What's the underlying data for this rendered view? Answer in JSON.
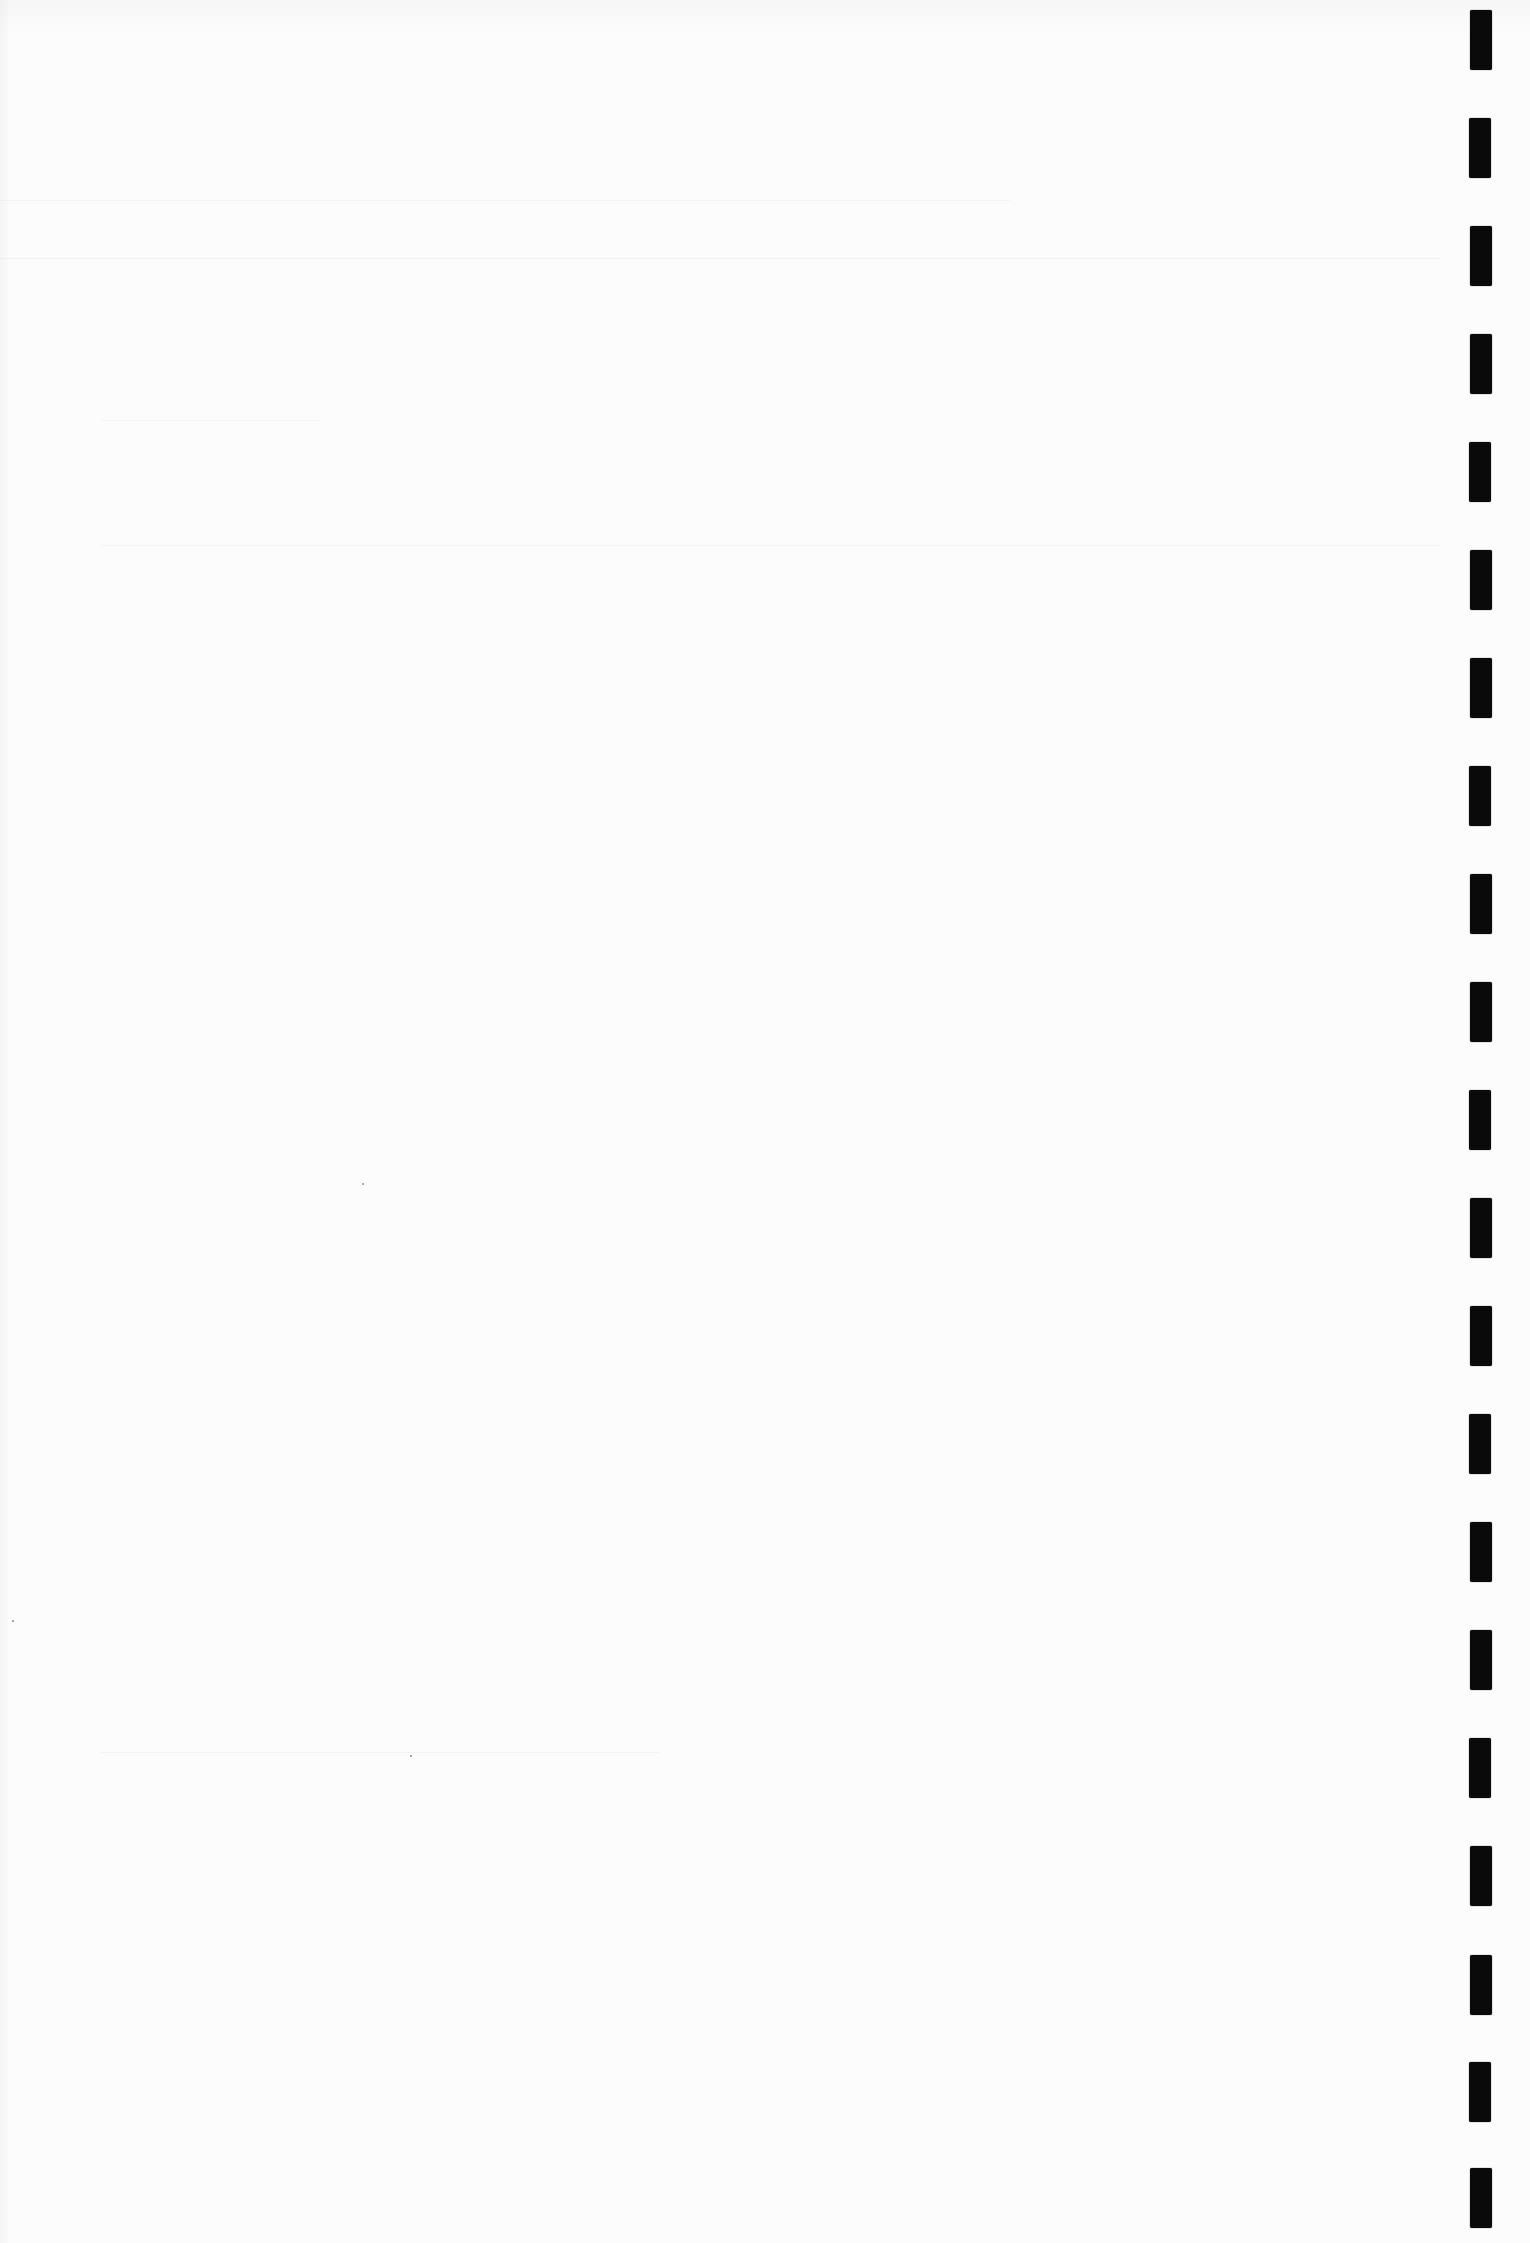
{
  "page": {
    "type": "blank scanned page",
    "background_color": "#fcfcfc",
    "text": ""
  },
  "binding_marks": {
    "color": "#0a0a0a",
    "x": 1470,
    "width": 22,
    "height": 60,
    "tops": [
      10,
      118,
      226,
      334,
      442,
      550,
      658,
      766,
      874,
      982,
      1090,
      1198,
      1306,
      1414,
      1522,
      1630,
      1738,
      1846,
      1955,
      2062,
      2168
    ]
  },
  "ghost_lines": [
    {
      "x": 0,
      "y": 200,
      "w": 1010
    },
    {
      "x": 0,
      "y": 258,
      "w": 1440
    },
    {
      "x": 100,
      "y": 420,
      "w": 220
    },
    {
      "x": 100,
      "y": 545,
      "w": 1340
    },
    {
      "x": 100,
      "y": 1752,
      "w": 560
    }
  ],
  "specks": [
    {
      "x": 362,
      "y": 1183
    },
    {
      "x": 12,
      "y": 1620
    },
    {
      "x": 410,
      "y": 1755
    }
  ]
}
